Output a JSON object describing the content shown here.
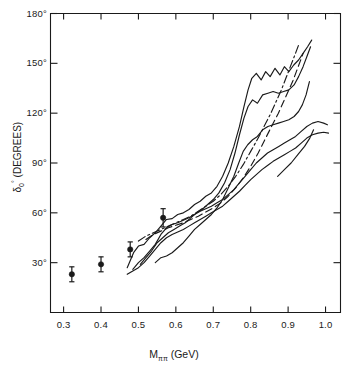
{
  "figure": {
    "background": "#ffffff",
    "ink_color": "#1a1a1a"
  },
  "axes": {
    "x_label_prefix": "M",
    "x_label_sub": "ππ",
    "x_label_unit": "(GeV)",
    "x_label_full": "Mππ (GeV)",
    "y_label_symbol": "δ",
    "y_label_sub": "0",
    "y_label_sup": "°",
    "y_label_unit": "(DEGREES)",
    "y_label_full": "δ0° (DEGREES)"
  },
  "ticks": {
    "x_labels": [
      "0.3",
      "0.4",
      "0.5",
      "0.6",
      "0.7",
      "0.8",
      "0.9",
      "1.0"
    ],
    "x_values": [
      0.3,
      0.4,
      0.5,
      0.6,
      0.7,
      0.8,
      0.9,
      1.0
    ],
    "y_labels": [
      "30°",
      "60°",
      "90°",
      "120°",
      "150°",
      "180°"
    ],
    "y_values": [
      30,
      60,
      90,
      120,
      150,
      180
    ]
  },
  "chart_data": {
    "type": "line",
    "title": "",
    "xlabel": "Mππ (GeV)",
    "ylabel": "δ0° (DEGREES)",
    "xlim": [
      0.265,
      1.04
    ],
    "ylim": [
      0,
      180
    ],
    "grid": false,
    "legend_position": "none",
    "points": {
      "name": "measured phase shift points",
      "marker": "filled-circle-with-error-bars",
      "x": [
        0.322,
        0.4,
        0.478,
        0.566
      ],
      "y": [
        23.0,
        29.0,
        38.0,
        57.0
      ],
      "yerr": [
        4.5,
        4.5,
        4.5,
        5.5
      ]
    },
    "series": [
      {
        "name": "upper error band (outer)",
        "style": "solid",
        "points": [
          [
            0.47,
            27.0
          ],
          [
            0.487,
            36.0
          ],
          [
            0.5,
            40.0
          ],
          [
            0.515,
            41.0
          ],
          [
            0.53,
            45.0
          ],
          [
            0.545,
            48.0
          ],
          [
            0.56,
            52.0
          ],
          [
            0.575,
            56.0
          ],
          [
            0.59,
            56.5
          ],
          [
            0.605,
            59.0
          ],
          [
            0.62,
            60.0
          ],
          [
            0.635,
            62.0
          ],
          [
            0.65,
            65.0
          ],
          [
            0.665,
            67.0
          ],
          [
            0.68,
            70.0
          ],
          [
            0.695,
            72.0
          ],
          [
            0.71,
            76.0
          ],
          [
            0.725,
            82.0
          ],
          [
            0.74,
            90.0
          ],
          [
            0.755,
            100.0
          ],
          [
            0.77,
            112.0
          ],
          [
            0.782,
            124.0
          ],
          [
            0.793,
            134.0
          ],
          [
            0.803,
            141.0
          ],
          [
            0.815,
            144.0
          ],
          [
            0.828,
            140.0
          ],
          [
            0.84,
            145.0
          ],
          [
            0.852,
            142.0
          ],
          [
            0.865,
            147.0
          ],
          [
            0.878,
            143.0
          ],
          [
            0.89,
            148.0
          ],
          [
            0.902,
            145.0
          ],
          [
            0.915,
            149.0
          ],
          [
            0.928,
            152.0
          ],
          [
            0.94,
            156.0
          ],
          [
            0.952,
            160.0
          ],
          [
            0.963,
            164.0
          ]
        ]
      },
      {
        "name": "upper error band (inner)",
        "style": "solid",
        "points": [
          [
            0.505,
            29.0
          ],
          [
            0.52,
            33.0
          ],
          [
            0.535,
            37.0
          ],
          [
            0.55,
            42.0
          ],
          [
            0.565,
            45.0
          ],
          [
            0.58,
            48.0
          ],
          [
            0.595,
            50.0
          ],
          [
            0.61,
            52.0
          ],
          [
            0.625,
            54.0
          ],
          [
            0.64,
            57.0
          ],
          [
            0.655,
            60.0
          ],
          [
            0.67,
            62.0
          ],
          [
            0.685,
            65.0
          ],
          [
            0.7,
            68.0
          ],
          [
            0.715,
            72.0
          ],
          [
            0.73,
            78.0
          ],
          [
            0.745,
            86.0
          ],
          [
            0.758,
            96.0
          ],
          [
            0.77,
            107.0
          ],
          [
            0.782,
            117.0
          ],
          [
            0.793,
            124.0
          ],
          [
            0.805,
            128.0
          ],
          [
            0.818,
            126.0
          ],
          [
            0.832,
            131.0
          ],
          [
            0.846,
            132.0
          ],
          [
            0.86,
            133.0
          ],
          [
            0.874,
            132.0
          ],
          [
            0.888,
            133.0
          ],
          [
            0.902,
            134.0
          ],
          [
            0.916,
            137.0
          ],
          [
            0.928,
            142.0
          ],
          [
            0.94,
            148.0
          ],
          [
            0.95,
            154.0
          ],
          [
            0.96,
            160.0
          ]
        ]
      },
      {
        "name": "lower band of upper contour",
        "style": "solid",
        "points": [
          [
            0.545,
            30.0
          ],
          [
            0.56,
            33.0
          ],
          [
            0.575,
            34.0
          ],
          [
            0.59,
            36.0
          ],
          [
            0.605,
            39.0
          ],
          [
            0.62,
            42.0
          ],
          [
            0.635,
            46.0
          ],
          [
            0.65,
            50.0
          ],
          [
            0.665,
            53.0
          ],
          [
            0.68,
            56.0
          ],
          [
            0.695,
            59.0
          ],
          [
            0.71,
            63.0
          ],
          [
            0.725,
            68.0
          ],
          [
            0.74,
            75.0
          ],
          [
            0.755,
            82.0
          ],
          [
            0.768,
            90.0
          ],
          [
            0.78,
            97.0
          ],
          [
            0.792,
            101.0
          ],
          [
            0.805,
            104.0
          ],
          [
            0.818,
            106.0
          ],
          [
            0.832,
            110.0
          ],
          [
            0.846,
            112.0
          ],
          [
            0.86,
            113.0
          ],
          [
            0.874,
            114.0
          ],
          [
            0.888,
            115.0
          ],
          [
            0.902,
            116.0
          ],
          [
            0.916,
            118.0
          ],
          [
            0.928,
            121.0
          ],
          [
            0.938,
            125.0
          ],
          [
            0.948,
            131.0
          ],
          [
            0.957,
            139.0
          ]
        ]
      },
      {
        "name": "central solid curve (upper)",
        "style": "solid",
        "points": [
          [
            0.485,
            26.0
          ],
          [
            0.5,
            30.0
          ],
          [
            0.515,
            33.0
          ],
          [
            0.53,
            37.0
          ],
          [
            0.545,
            41.0
          ],
          [
            0.56,
            47.0
          ],
          [
            0.575,
            51.0
          ],
          [
            0.59,
            53.0
          ],
          [
            0.605,
            54.0
          ],
          [
            0.62,
            55.5
          ],
          [
            0.635,
            57.0
          ],
          [
            0.65,
            59.0
          ],
          [
            0.665,
            61.0
          ],
          [
            0.68,
            62.5
          ],
          [
            0.695,
            64.0
          ],
          [
            0.71,
            66.0
          ],
          [
            0.725,
            68.0
          ],
          [
            0.74,
            71.0
          ],
          [
            0.755,
            74.0
          ],
          [
            0.77,
            78.0
          ],
          [
            0.785,
            82.0
          ],
          [
            0.8,
            86.0
          ],
          [
            0.815,
            90.0
          ],
          [
            0.83,
            93.0
          ],
          [
            0.845,
            96.0
          ],
          [
            0.86,
            98.0
          ],
          [
            0.875,
            100.0
          ],
          [
            0.89,
            102.0
          ],
          [
            0.905,
            104.0
          ],
          [
            0.92,
            106.0
          ],
          [
            0.935,
            109.0
          ],
          [
            0.95,
            112.0
          ],
          [
            0.965,
            114.0
          ],
          [
            0.98,
            115.0
          ],
          [
            0.995,
            114.0
          ],
          [
            1.005,
            113.0
          ]
        ]
      },
      {
        "name": "central solid curve (lower)",
        "style": "solid",
        "points": [
          [
            0.47,
            23.0
          ],
          [
            0.485,
            25.0
          ],
          [
            0.5,
            27.0
          ],
          [
            0.515,
            30.0
          ],
          [
            0.53,
            34.0
          ],
          [
            0.545,
            38.0
          ],
          [
            0.56,
            42.0
          ],
          [
            0.575,
            45.0
          ],
          [
            0.59,
            47.0
          ],
          [
            0.605,
            48.5
          ],
          [
            0.62,
            50.0
          ],
          [
            0.635,
            52.0
          ],
          [
            0.65,
            54.0
          ],
          [
            0.665,
            56.0
          ],
          [
            0.68,
            58.0
          ],
          [
            0.695,
            60.0
          ],
          [
            0.71,
            62.0
          ],
          [
            0.725,
            64.0
          ],
          [
            0.74,
            67.0
          ],
          [
            0.755,
            70.0
          ],
          [
            0.77,
            73.0
          ],
          [
            0.785,
            76.5
          ],
          [
            0.8,
            80.0
          ],
          [
            0.815,
            83.0
          ],
          [
            0.83,
            86.0
          ],
          [
            0.845,
            88.5
          ],
          [
            0.86,
            91.0
          ],
          [
            0.875,
            93.0
          ],
          [
            0.89,
            95.0
          ],
          [
            0.905,
            97.0
          ],
          [
            0.92,
            99.0
          ],
          [
            0.935,
            102.0
          ],
          [
            0.95,
            105.0
          ],
          [
            0.965,
            107.0
          ],
          [
            0.98,
            108.0
          ],
          [
            0.995,
            108.5
          ],
          [
            1.008,
            108.0
          ]
        ]
      },
      {
        "name": "dashed curve",
        "style": "dashed",
        "points": [
          [
            0.52,
            44.0
          ],
          [
            0.54,
            47.0
          ],
          [
            0.56,
            49.0
          ],
          [
            0.58,
            51.0
          ],
          [
            0.6,
            52.5
          ],
          [
            0.62,
            54.0
          ],
          [
            0.64,
            56.0
          ],
          [
            0.66,
            58.0
          ],
          [
            0.68,
            60.5
          ],
          [
            0.7,
            63.0
          ],
          [
            0.72,
            66.0
          ],
          [
            0.74,
            70.0
          ],
          [
            0.76,
            75.0
          ],
          [
            0.78,
            81.0
          ],
          [
            0.8,
            88.0
          ],
          [
            0.82,
            96.0
          ],
          [
            0.84,
            105.0
          ],
          [
            0.858,
            113.0
          ],
          [
            0.874,
            120.0
          ],
          [
            0.888,
            127.0
          ],
          [
            0.9,
            133.0
          ],
          [
            0.912,
            139.0
          ],
          [
            0.922,
            145.0
          ],
          [
            0.932,
            151.0
          ],
          [
            0.94,
            156.0
          ]
        ]
      },
      {
        "name": "dash-dot curve",
        "style": "dashdot",
        "points": [
          [
            0.5,
            43.0
          ],
          [
            0.52,
            46.0
          ],
          [
            0.54,
            48.0
          ],
          [
            0.56,
            50.0
          ],
          [
            0.58,
            52.0
          ],
          [
            0.6,
            54.0
          ],
          [
            0.62,
            56.0
          ],
          [
            0.64,
            58.0
          ],
          [
            0.66,
            61.0
          ],
          [
            0.68,
            64.0
          ],
          [
            0.7,
            67.0
          ],
          [
            0.72,
            71.0
          ],
          [
            0.74,
            76.0
          ],
          [
            0.76,
            82.0
          ],
          [
            0.78,
            89.0
          ],
          [
            0.8,
            97.0
          ],
          [
            0.82,
            105.0
          ],
          [
            0.838,
            113.0
          ],
          [
            0.854,
            120.0
          ],
          [
            0.868,
            127.0
          ],
          [
            0.882,
            134.0
          ],
          [
            0.894,
            141.0
          ],
          [
            0.906,
            148.0
          ],
          [
            0.918,
            155.0
          ],
          [
            0.928,
            161.0
          ]
        ]
      },
      {
        "name": "short rising segment (lower right)",
        "style": "solid",
        "points": [
          [
            0.872,
            82.0
          ],
          [
            0.89,
            86.0
          ],
          [
            0.908,
            90.0
          ],
          [
            0.926,
            95.0
          ],
          [
            0.944,
            100.0
          ],
          [
            0.958,
            105.0
          ],
          [
            0.968,
            110.0
          ]
        ]
      }
    ]
  }
}
